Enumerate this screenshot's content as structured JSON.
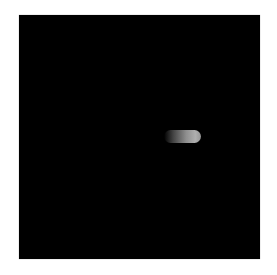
{
  "image": {
    "description": "Dark-field fluorescence micrograph with a single glowing rod-shaped object",
    "background_color": "#000000",
    "border_color": "#ffffff",
    "object": {
      "shape": "rod",
      "color_start": "#282828",
      "color_end": "#afafaf"
    }
  }
}
